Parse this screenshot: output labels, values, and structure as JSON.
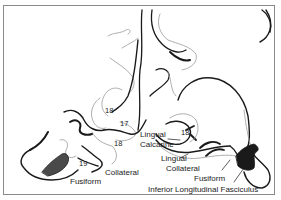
{
  "figure": {
    "type": "neuroanatomy-section-illustration",
    "labels": {
      "area18_top": "18",
      "area17": "17",
      "area18_lower": "18",
      "area19": "19",
      "fusiform_left": "Fusiform",
      "collateral_left": "Collateral",
      "lingual_upper": "Lingual",
      "calcarine": "Calcarine",
      "area18_right": "18",
      "lingual_lower": "Lingual",
      "collateral_right": "Collateral",
      "fusiform_right": "Fusiform",
      "ilf": "Inferior Longitudinal Fasciculus"
    },
    "colors": {
      "ink": "#1a1a1a",
      "gray_line": "#9a9a9a",
      "frame": "#8a8a8a",
      "shade": "#4a4a4a"
    }
  }
}
